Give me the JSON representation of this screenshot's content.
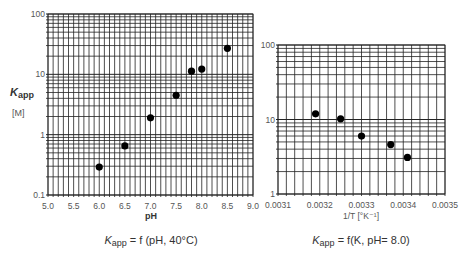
{
  "chart_data": [
    {
      "type": "scatter",
      "title": "",
      "caption_main": "K",
      "caption_sub": "app",
      "caption_rest": " = f (pH, 40°C)",
      "xlabel": "pH",
      "ylabel_main": "K",
      "ylabel_sub": "app",
      "ylabel_unit": "[M]",
      "xscale": "linear",
      "yscale": "log",
      "xlim": [
        5.0,
        9.0
      ],
      "ylim": [
        0.1,
        100
      ],
      "xticks": [
        "5.0",
        "5.5",
        "6.0",
        "6.5",
        "7.0",
        "7.5",
        "8.0",
        "8.5",
        "9.0"
      ],
      "yticks": [
        "0.1",
        "1",
        "10",
        "100"
      ],
      "grid": true,
      "x": [
        6.0,
        6.5,
        7.0,
        7.5,
        7.8,
        8.0,
        8.5
      ],
      "y": [
        0.29,
        0.65,
        1.9,
        4.5,
        11.3,
        12.2,
        27
      ]
    },
    {
      "type": "scatter",
      "title": "",
      "caption_main": "K",
      "caption_sub": "app",
      "caption_rest": " = f(K, pH= 8.0)",
      "xlabel": "1/T  [°K⁻¹]",
      "ylabel_main": "",
      "xscale": "linear",
      "yscale": "log",
      "xlim": [
        0.0031,
        0.0035
      ],
      "ylim": [
        1,
        100
      ],
      "xticks": [
        "0.0031",
        "0.0032",
        "0.0033",
        "0.0034",
        "0.0035"
      ],
      "yticks": [
        "1",
        "10",
        "100"
      ],
      "grid": true,
      "x": [
        0.00319,
        0.00325,
        0.0033,
        0.00337,
        0.00341
      ],
      "y": [
        11.9,
        10.2,
        6.0,
        4.6,
        3.1
      ]
    }
  ]
}
